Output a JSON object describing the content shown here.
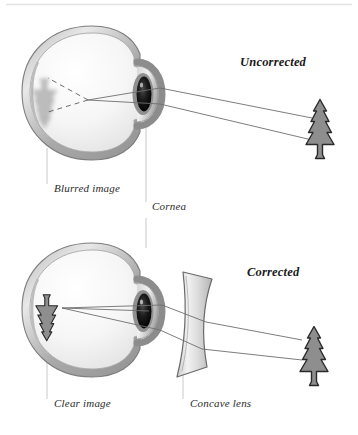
{
  "figure": {
    "title_alt": "Myopia correction diagram",
    "background_color": "#ffffff",
    "top_rule_color": "#e2e2e2",
    "width": 358,
    "height": 435
  },
  "panels": [
    {
      "id": "uncorrected",
      "heading": "Uncorrected",
      "description": "Eye without lens; light focuses in front of the retina producing a blurred image.",
      "labels": [
        {
          "name": "blurred-image",
          "text": "Blurred image"
        },
        {
          "name": "cornea",
          "text": "Cornea"
        }
      ],
      "object": {
        "name": "pine-tree",
        "state": "distant object"
      },
      "retinal_image": {
        "name": "blurred-tree",
        "state": "blurred"
      },
      "ray_count": 2
    },
    {
      "id": "corrected",
      "heading": "Corrected",
      "description": "Eye with concave lens; light focuses on the retina producing a clear image.",
      "labels": [
        {
          "name": "clear-image",
          "text": "Clear image"
        },
        {
          "name": "concave-lens",
          "text": "Concave lens"
        }
      ],
      "object": {
        "name": "pine-tree",
        "state": "distant object"
      },
      "retinal_image": {
        "name": "clear-tree",
        "state": "sharp"
      },
      "optic": {
        "name": "concave-lens",
        "type": "biconcave"
      },
      "ray_count": 2
    }
  ],
  "colors": {
    "ink": "#2b2b2b",
    "heading": "#1a1a1a",
    "ray": "#6e6e6e",
    "leader": "#c6c6c6",
    "sclera_outer": "#9a9a9a",
    "sclera_mid": "#cfcfcf",
    "vitreous": "#f4f4f4",
    "cornea": "#b5b5b5",
    "pupil": "#141414",
    "tree_fill": "#8e8e8e",
    "tree_stroke": "#2a2a2a",
    "blur_fill": "#b9b9b9",
    "lens_fill": "#dcdcdc",
    "lens_stroke": "#6a6a6a"
  }
}
